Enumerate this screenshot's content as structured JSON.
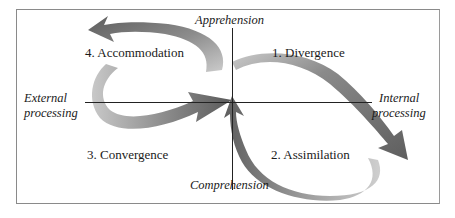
{
  "diagram": {
    "type": "experiential-learning-cycle",
    "axes": {
      "top": "Apprehension",
      "bottom": "Comprehension",
      "left": [
        "External",
        "processing"
      ],
      "right": [
        "Internal",
        "processing"
      ]
    },
    "stages": [
      {
        "label": "1. Divergence",
        "quadrant": "top-right"
      },
      {
        "label": "2. Assimilation",
        "quadrant": "bottom-right"
      },
      {
        "label": "3. Convergence",
        "quadrant": "bottom-left"
      },
      {
        "label": "4. Accommodation",
        "quadrant": "top-left"
      }
    ],
    "colors": {
      "dark_arrow": "#6e6e6e",
      "light_arrow": "#c4c4c4",
      "axis_line": "#222222",
      "frame": "#8a8a8a"
    }
  }
}
